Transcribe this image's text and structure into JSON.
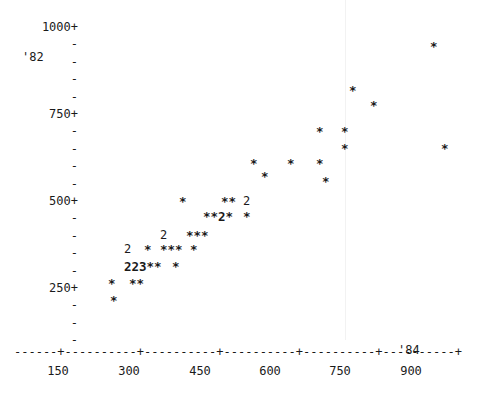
{
  "chart_data": {
    "type": "scatter",
    "title": "",
    "subtitle": "",
    "xlabel": "",
    "ylabel": "",
    "corner_label": "'82",
    "x_end_label": "'84",
    "xlim": [
      0,
      975
    ],
    "ylim": [
      0,
      1050
    ],
    "grid": false,
    "legend": false,
    "y_axis": {
      "major_labels": [
        "1000+",
        "750+",
        "500+",
        "250+"
      ],
      "major_values": [
        1000,
        750,
        500,
        250
      ],
      "tick_glyph": "-",
      "label_suffix": "+",
      "minor_ticks_between": 4
    },
    "x_axis": {
      "tick_labels": [
        "150",
        "300",
        "450",
        "600",
        "750",
        "900"
      ],
      "tick_values": [
        150,
        300,
        450,
        600,
        750,
        900
      ],
      "axis_glyph_line": "------+----------+----------+----------+----------+----------+",
      "tick_glyph": "+",
      "dash_glyph": "-"
    },
    "points": [
      {
        "x": 120,
        "y": 160,
        "count": 1,
        "glyph": "*"
      },
      {
        "x": 120,
        "y": 135,
        "count": 1,
        "glyph": "*"
      },
      {
        "x": 145,
        "y": 160,
        "count": 1,
        "glyph": "*"
      },
      {
        "x": 155,
        "y": 160,
        "count": 1,
        "glyph": "*"
      },
      {
        "x": 132,
        "y": 205,
        "count": 2,
        "glyph": "2"
      },
      {
        "x": 140,
        "y": 205,
        "count": 2,
        "glyph": "2"
      },
      {
        "x": 148,
        "y": 205,
        "count": 3,
        "glyph": "3"
      },
      {
        "x": 157,
        "y": 205,
        "count": 1,
        "glyph": "*"
      },
      {
        "x": 165,
        "y": 205,
        "count": 1,
        "glyph": "*"
      },
      {
        "x": 180,
        "y": 205,
        "count": 1,
        "glyph": "*"
      },
      {
        "x": 133,
        "y": 250,
        "count": 2,
        "glyph": "2"
      },
      {
        "x": 150,
        "y": 250,
        "count": 1,
        "glyph": "*"
      },
      {
        "x": 165,
        "y": 250,
        "count": 1,
        "glyph": "*"
      },
      {
        "x": 173,
        "y": 250,
        "count": 1,
        "glyph": "*"
      },
      {
        "x": 181,
        "y": 250,
        "count": 1,
        "glyph": "*"
      },
      {
        "x": 196,
        "y": 250,
        "count": 1,
        "glyph": "*"
      },
      {
        "x": 176,
        "y": 295,
        "count": 2,
        "glyph": "2"
      },
      {
        "x": 200,
        "y": 295,
        "count": 1,
        "glyph": "*"
      },
      {
        "x": 208,
        "y": 295,
        "count": 1,
        "glyph": "*"
      },
      {
        "x": 216,
        "y": 295,
        "count": 1,
        "glyph": "*"
      },
      {
        "x": 223,
        "y": 340,
        "count": 1,
        "glyph": "*"
      },
      {
        "x": 231,
        "y": 340,
        "count": 1,
        "glyph": "*"
      },
      {
        "x": 239,
        "y": 340,
        "count": 2,
        "glyph": "2"
      },
      {
        "x": 247,
        "y": 340,
        "count": 1,
        "glyph": "*"
      },
      {
        "x": 262,
        "y": 340,
        "count": 1,
        "glyph": "*"
      },
      {
        "x": 200,
        "y": 385,
        "count": 1,
        "glyph": "*"
      },
      {
        "x": 240,
        "y": 385,
        "count": 1,
        "glyph": "*"
      },
      {
        "x": 248,
        "y": 385,
        "count": 1,
        "glyph": "*"
      },
      {
        "x": 263,
        "y": 385,
        "count": 2,
        "glyph": "2"
      },
      {
        "x": 277,
        "y": 430,
        "count": 1,
        "glyph": "*"
      },
      {
        "x": 255,
        "y": 470,
        "count": 1,
        "glyph": "*"
      },
      {
        "x": 300,
        "y": 470,
        "count": 1,
        "glyph": "*"
      },
      {
        "x": 330,
        "y": 470,
        "count": 1,
        "glyph": "*"
      },
      {
        "x": 350,
        "y": 470,
        "count": 1,
        "glyph": "*"
      },
      {
        "x": 282,
        "y": 430,
        "count": 1,
        "glyph": "*"
      },
      {
        "x": 370,
        "y": 430,
        "count": 1,
        "glyph": "*"
      },
      {
        "x": 350,
        "y": 520,
        "count": 1,
        "glyph": "*"
      },
      {
        "x": 420,
        "y": 565,
        "count": 1,
        "glyph": "*"
      },
      {
        "x": 465,
        "y": 565,
        "count": 1,
        "glyph": "*"
      },
      {
        "x": 465,
        "y": 610,
        "count": 1,
        "glyph": "*"
      },
      {
        "x": 545,
        "y": 700,
        "count": 1,
        "glyph": "*"
      },
      {
        "x": 590,
        "y": 655,
        "count": 1,
        "glyph": "*"
      },
      {
        "x": 720,
        "y": 790,
        "count": 1,
        "glyph": "*"
      },
      {
        "x": 780,
        "y": 765,
        "count": 1,
        "glyph": "*"
      },
      {
        "x": 880,
        "y": 620,
        "count": 1,
        "glyph": "*"
      },
      {
        "x": 940,
        "y": 945,
        "count": 1,
        "glyph": "*"
      }
    ]
  },
  "y_rows": [
    {
      "text": "1000+",
      "is_major": true
    },
    {
      "text": "-",
      "is_major": false
    },
    {
      "text": "-",
      "is_major": false
    },
    {
      "text": "-",
      "is_major": false
    },
    {
      "text": "-",
      "is_major": false
    },
    {
      "text": "750+",
      "is_major": true
    },
    {
      "text": "-",
      "is_major": false
    },
    {
      "text": "-",
      "is_major": false
    },
    {
      "text": "-",
      "is_major": false
    },
    {
      "text": "-",
      "is_major": false
    },
    {
      "text": "500+",
      "is_major": true
    },
    {
      "text": "-",
      "is_major": false
    },
    {
      "text": "-",
      "is_major": false
    },
    {
      "text": "-",
      "is_major": false
    },
    {
      "text": "-",
      "is_major": false
    },
    {
      "text": "250+",
      "is_major": true
    },
    {
      "text": "-",
      "is_major": false
    },
    {
      "text": "-",
      "is_major": false
    },
    {
      "text": "-",
      "is_major": false
    }
  ],
  "corner": {
    "label": "'82"
  },
  "xaxis": {
    "line": "------+----------+----------+----------+----------+----------+",
    "end_label": "'84",
    "labels": [
      "150",
      "300",
      "450",
      "600",
      "750",
      "900"
    ]
  },
  "plot_rows": [
    {
      "top": 41,
      "left": 430,
      "text": "*"
    },
    {
      "top": 85,
      "left": 349,
      "text": "*"
    },
    {
      "top": 100,
      "left": 370,
      "text": "*"
    },
    {
      "top": 126,
      "left": 316,
      "text": "*"
    },
    {
      "top": 126,
      "left": 341,
      "text": "*"
    },
    {
      "top": 143,
      "left": 341,
      "text": "*"
    },
    {
      "top": 143,
      "left": 441,
      "text": "*"
    },
    {
      "top": 158,
      "left": 250,
      "text": "*"
    },
    {
      "top": 158,
      "left": 287,
      "text": "*"
    },
    {
      "top": 158,
      "left": 316,
      "text": "*"
    },
    {
      "top": 171,
      "left": 261,
      "text": "*"
    },
    {
      "top": 176,
      "left": 322,
      "text": "*"
    },
    {
      "top": 196,
      "left": 179,
      "text": "*"
    },
    {
      "top": 196,
      "left": 221,
      "text": "**"
    },
    {
      "top": 196,
      "left": 243,
      "text": "2"
    },
    {
      "top": 211,
      "left": 203,
      "text": "**2*"
    },
    {
      "top": 211,
      "left": 243,
      "text": "*"
    },
    {
      "top": 230,
      "left": 160,
      "text": "2"
    },
    {
      "top": 230,
      "left": 186,
      "text": "***"
    },
    {
      "top": 244,
      "left": 124,
      "text": "2"
    },
    {
      "top": 244,
      "left": 144,
      "text": "*"
    },
    {
      "top": 244,
      "left": 160,
      "text": "***"
    },
    {
      "top": 244,
      "left": 190,
      "text": "*"
    },
    {
      "top": 261,
      "left": 124,
      "text": "223**"
    },
    {
      "top": 261,
      "left": 172,
      "text": "*"
    },
    {
      "top": 278,
      "left": 108,
      "text": "*"
    },
    {
      "top": 278,
      "left": 129,
      "text": "**"
    },
    {
      "top": 295,
      "left": 110,
      "text": "*"
    }
  ]
}
